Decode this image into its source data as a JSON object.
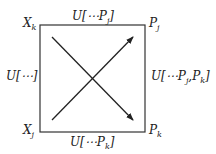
{
  "diagram": {
    "corners": {
      "top_left": "X_k",
      "top_right": "P_j",
      "bottom_left": "X_j",
      "bottom_right": "P_k"
    },
    "edges": {
      "top": "U[⋯P_j]",
      "left": "U[⋯]",
      "right": "U[⋯P_j, P_k]",
      "bottom": "U[⋯P_k]"
    },
    "arrows": [
      {
        "from": "bottom-left",
        "to": "top-right"
      },
      {
        "from": "top-left",
        "to": "bottom-right"
      }
    ]
  }
}
